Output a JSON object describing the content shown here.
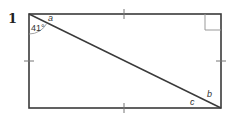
{
  "question_number": "1",
  "diagram": {
    "shape": "rectangle",
    "diagonal": "top-left to bottom-right",
    "equal_side_ticks": true,
    "right_angle_marker": "top-right",
    "labels": {
      "angle_given": "41°",
      "angle_a": "a",
      "angle_b": "b",
      "angle_c": "c"
    },
    "colors": {
      "stroke": "#3a3a3a",
      "marker": "#999999"
    }
  }
}
